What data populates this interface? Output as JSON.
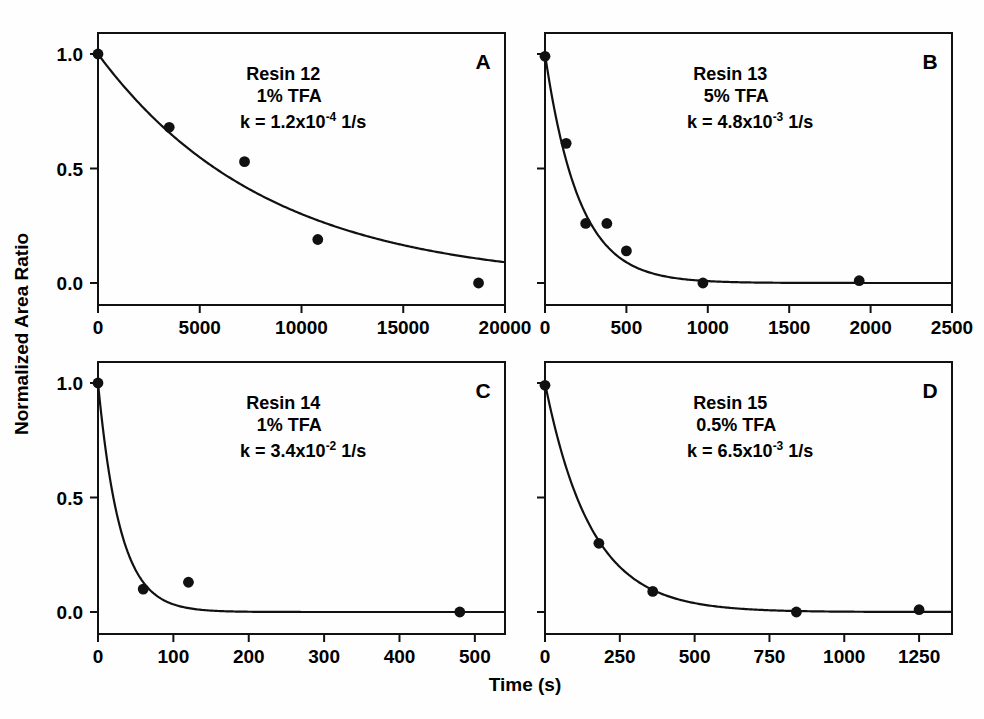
{
  "figure": {
    "xlabel": "Time (s)",
    "ylabel": "Normalized Area Ratio"
  },
  "chart_data": [
    {
      "type": "scatter",
      "panel": "A",
      "title": "Resin 12",
      "subtitle": "1% TFA",
      "rate_prefix": "k = 1.2x10",
      "rate_exponent": "-4",
      "rate_suffix": " 1/s",
      "rate_constant": 0.00012,
      "rate_units": "1/s",
      "xlabel": "Time (s)",
      "ylabel": "Normalized Area Ratio",
      "xlim": [
        0,
        20000
      ],
      "ylim": [
        -0.08,
        1.12
      ],
      "xticks": [
        0,
        5000,
        10000,
        15000,
        20000
      ],
      "xticklabels": [
        "0",
        "5000",
        "10000",
        "15000",
        "20000"
      ],
      "yticks": [
        0.0,
        0.5,
        1.0
      ],
      "yticklabels": [
        "0.0",
        "0.5",
        "1.0"
      ],
      "grid": false,
      "legend": "none",
      "x": [
        0,
        3500,
        7200,
        10800,
        18700
      ],
      "y": [
        1.0,
        0.68,
        0.53,
        0.19,
        0.0
      ],
      "fit": "y = exp(-k*t)"
    },
    {
      "type": "scatter",
      "panel": "B",
      "title": "Resin 13",
      "subtitle": "5% TFA",
      "rate_prefix": "k = 4.8x10",
      "rate_exponent": "-3",
      "rate_suffix": " 1/s",
      "rate_constant": 0.0048,
      "rate_units": "1/s",
      "xlabel": "Time (s)",
      "ylabel": "Normalized Area Ratio",
      "xlim": [
        0,
        2500
      ],
      "ylim": [
        -0.08,
        1.12
      ],
      "xticks": [
        0,
        500,
        1000,
        1500,
        2000,
        2500
      ],
      "xticklabels": [
        "0",
        "500",
        "1000",
        "1500",
        "2000",
        "2500"
      ],
      "yticks": [
        0.0,
        0.5,
        1.0
      ],
      "yticklabels": [
        "0.0",
        "0.5",
        "1.0"
      ],
      "grid": false,
      "legend": "none",
      "x": [
        0,
        130,
        250,
        380,
        500,
        970,
        1930
      ],
      "y": [
        0.99,
        0.61,
        0.26,
        0.26,
        0.14,
        0.0,
        0.01
      ],
      "fit": "y = exp(-k*t)"
    },
    {
      "type": "scatter",
      "panel": "C",
      "title": "Resin 14",
      "subtitle": "1% TFA",
      "rate_prefix": "k = 3.4x10",
      "rate_exponent": "-2",
      "rate_suffix": " 1/s",
      "rate_constant": 0.034,
      "rate_units": "1/s",
      "xlabel": "Time (s)",
      "ylabel": "Normalized Area Ratio",
      "xlim": [
        0,
        540
      ],
      "ylim": [
        -0.08,
        1.12
      ],
      "xticks": [
        0,
        100,
        200,
        300,
        400,
        500
      ],
      "xticklabels": [
        "0",
        "100",
        "200",
        "300",
        "400",
        "500"
      ],
      "yticks": [
        0.0,
        0.5,
        1.0
      ],
      "yticklabels": [
        "0.0",
        "0.5",
        "1.0"
      ],
      "grid": false,
      "legend": "none",
      "x": [
        0,
        60,
        120,
        480
      ],
      "y": [
        1.0,
        0.1,
        0.13,
        0.0
      ],
      "fit": "y = exp(-k*t)"
    },
    {
      "type": "scatter",
      "panel": "D",
      "title": "Resin 15",
      "subtitle": "0.5% TFA",
      "rate_prefix": "k = 6.5x10",
      "rate_exponent": "-3",
      "rate_suffix": " 1/s",
      "rate_constant": 0.0065,
      "rate_units": "1/s",
      "xlabel": "Time (s)",
      "ylabel": "Normalized Area Ratio",
      "xlim": [
        0,
        1360
      ],
      "ylim": [
        -0.08,
        1.12
      ],
      "xticks": [
        0,
        250,
        500,
        750,
        1000,
        1250
      ],
      "xticklabels": [
        "0",
        "250",
        "500",
        "750",
        "1000",
        "1250"
      ],
      "yticks": [
        0.0,
        0.5,
        1.0
      ],
      "yticklabels": [
        "0.0",
        "0.5",
        "1.0"
      ],
      "grid": false,
      "legend": "none",
      "x": [
        0,
        180,
        360,
        840,
        1250
      ],
      "y": [
        0.99,
        0.3,
        0.09,
        0.0,
        0.01
      ],
      "fit": "y = exp(-k*t)"
    }
  ]
}
